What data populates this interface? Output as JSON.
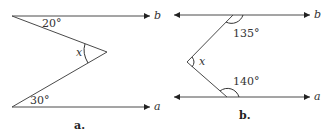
{
  "figures": [
    {
      "caption": "a.",
      "lines": {
        "top": "b",
        "bottom": "a"
      },
      "angles": {
        "top": "20°",
        "bottom": "30°",
        "vertex": "x"
      }
    },
    {
      "caption": "b.",
      "lines": {
        "top": "b",
        "bottom": "a"
      },
      "angles": {
        "top": "135°",
        "bottom": "140°",
        "vertex": "x"
      }
    }
  ],
  "colors": {
    "line": "#4a4a4a",
    "text": "#333333"
  }
}
